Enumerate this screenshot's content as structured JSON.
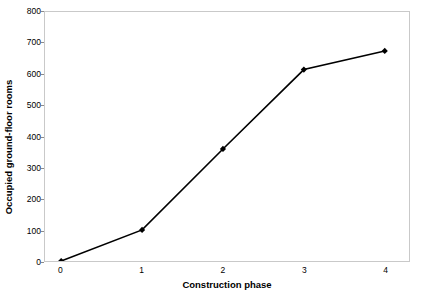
{
  "chart_data": {
    "type": "line",
    "title": "",
    "xlabel": "Construction phase",
    "ylabel": "Occupied ground-floor rooms",
    "x": [
      0,
      1,
      2,
      3,
      4
    ],
    "values": [
      0,
      100,
      360,
      615,
      675
    ],
    "xtick_labels": [
      "0",
      "1",
      "2",
      "3",
      "4"
    ],
    "ytick_labels": [
      "0",
      "100",
      "200",
      "300",
      "400",
      "500",
      "600",
      "700",
      "800"
    ],
    "ytick_values": [
      0,
      100,
      200,
      300,
      400,
      500,
      600,
      700,
      800
    ],
    "xlim": [
      -0.2,
      4.3
    ],
    "ylim": [
      0,
      800
    ],
    "grid": false,
    "legend": "none",
    "series_color": "#000000",
    "marker": "diamond",
    "plot_border_color": "#c9c9c9"
  }
}
